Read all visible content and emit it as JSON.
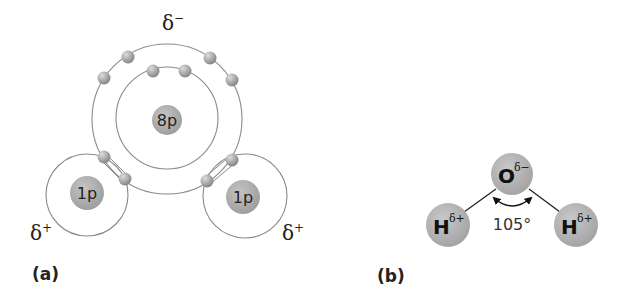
{
  "panel_a": {
    "label": "(a)",
    "oxygen_nucleus": "8p",
    "hydrogen_left_nucleus": "1p",
    "hydrogen_right_nucleus": "1p",
    "charge_top": "δ",
    "charge_top_sign": "−",
    "charge_left": "δ",
    "charge_left_sign": "+",
    "charge_right": "δ",
    "charge_right_sign": "+"
  },
  "panel_b": {
    "label": "(b)",
    "oxygen_symbol": "O",
    "oxygen_charge": "δ−",
    "hydrogen_left_symbol": "H",
    "hydrogen_left_charge": "δ+",
    "hydrogen_right_symbol": "H",
    "hydrogen_right_charge": "δ+",
    "bond_angle": "105°"
  },
  "colors": {
    "nucleus": "#a8a8a8",
    "electron": "#9a9a9a",
    "atom_b": "#b0b0b0",
    "orbit": "#8a8a8a",
    "text": "#222222"
  }
}
